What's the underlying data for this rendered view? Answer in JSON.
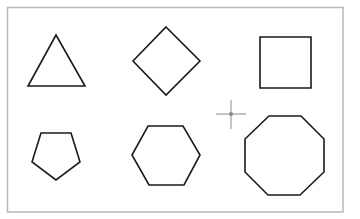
{
  "canvas": {
    "background": "#ffffff",
    "frame_color": "#b8b8b8",
    "stroke_color": "#1a1a1a",
    "cursor_color": "#8a8a8a"
  },
  "shapes": [
    {
      "name": "triangle",
      "sides": 3,
      "points": "56,35 85,86 28,86"
    },
    {
      "name": "diamond",
      "sides": 4,
      "points": "166,27 200,61 166,95 133,61"
    },
    {
      "name": "square",
      "sides": 4,
      "points": "260,37 311,37 311,88 260,88"
    },
    {
      "name": "pentagon",
      "sides": 5,
      "points": "41,133 71,133 80,162 56,180 32,162"
    },
    {
      "name": "hexagon",
      "sides": 6,
      "points": "148,126 183,126 200,155 184,185 149,185 132,155"
    },
    {
      "name": "octagon",
      "sides": 8,
      "points": "269,116 301,116 324,139 324,172 300,195 268,195 245,172 245,139"
    }
  ],
  "cursor": {
    "type": "crosshair",
    "x": 231,
    "y": 114
  }
}
